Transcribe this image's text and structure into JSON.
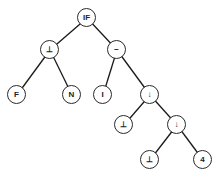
{
  "diagram": {
    "type": "tree",
    "line_color": "#1a1a1a",
    "nodes": [
      {
        "id": "n0",
        "label": "IF",
        "x": 87,
        "y": 18
      },
      {
        "id": "n1",
        "label": "⊥",
        "x": 50,
        "y": 50
      },
      {
        "id": "n2",
        "label": "−",
        "x": 117,
        "y": 50
      },
      {
        "id": "n3",
        "label": "F",
        "x": 17,
        "y": 95
      },
      {
        "id": "n4",
        "label": "N",
        "x": 72,
        "y": 95
      },
      {
        "id": "n5",
        "label": "I",
        "x": 103,
        "y": 95
      },
      {
        "id": "n6",
        "label": "↓",
        "x": 150,
        "y": 95
      },
      {
        "id": "n7",
        "label": "⊥",
        "x": 124,
        "y": 125
      },
      {
        "id": "n8",
        "label": "↓",
        "x": 177,
        "y": 125
      },
      {
        "id": "n9",
        "label": "⊥",
        "x": 150,
        "y": 160
      },
      {
        "id": "n10",
        "label": "4",
        "x": 203,
        "y": 160
      }
    ],
    "edges": [
      [
        "n0",
        "n1"
      ],
      [
        "n0",
        "n2"
      ],
      [
        "n1",
        "n3"
      ],
      [
        "n1",
        "n4"
      ],
      [
        "n2",
        "n5"
      ],
      [
        "n2",
        "n6"
      ],
      [
        "n6",
        "n7"
      ],
      [
        "n6",
        "n8"
      ],
      [
        "n8",
        "n9"
      ],
      [
        "n8",
        "n10"
      ]
    ]
  }
}
